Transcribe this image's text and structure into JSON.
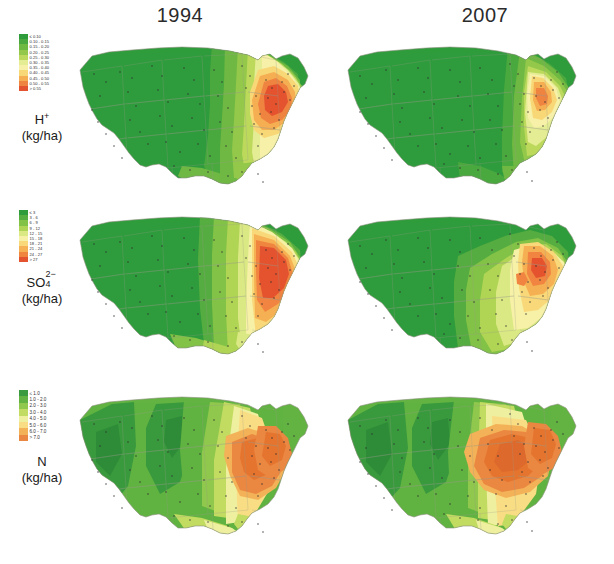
{
  "figure": {
    "columns": [
      {
        "label": "1994"
      },
      {
        "label": "2007"
      }
    ],
    "caption": ""
  },
  "rows": [
    {
      "id": "hydrogen",
      "symbol": "H",
      "symbol_charge": "+",
      "unit": "(kg/ha)",
      "legend": {
        "classes": [
          {
            "label": "≤ 0.10",
            "color": "#2f9c3c"
          },
          {
            "label": "0.10 - 0.15",
            "color": "#4aa83f"
          },
          {
            "label": "0.15 - 0.20",
            "color": "#6fb943"
          },
          {
            "label": "0.20 - 0.25",
            "color": "#93c84b"
          },
          {
            "label": "0.25 - 0.30",
            "color": "#bcd95d"
          },
          {
            "label": "0.30 - 0.35",
            "color": "#e4ec94"
          },
          {
            "label": "0.35 - 0.40",
            "color": "#f6f0a8"
          },
          {
            "label": "0.40 - 0.45",
            "color": "#f8d777"
          },
          {
            "label": "0.45 - 0.50",
            "color": "#f5ae52"
          },
          {
            "label": "0.50 - 0.55",
            "color": "#ef8340"
          },
          {
            "label": "> 0.55",
            "color": "#e4532f"
          }
        ]
      }
    },
    {
      "id": "sulfate",
      "symbol": "SO",
      "symbol_charge": "2−",
      "symbol_sub": "4",
      "unit": "(kg/ha)",
      "legend": {
        "classes": [
          {
            "label": "≤ 3",
            "color": "#2f9c3c"
          },
          {
            "label": "3 - 6",
            "color": "#56ad40"
          },
          {
            "label": "6 - 9",
            "color": "#82c247"
          },
          {
            "label": "9 - 12",
            "color": "#b0d455"
          },
          {
            "label": "12 - 15",
            "color": "#dbe985"
          },
          {
            "label": "15 - 18",
            "color": "#f6f1a6"
          },
          {
            "label": "18 - 21",
            "color": "#f9d87a"
          },
          {
            "label": "21 - 24",
            "color": "#f5b153"
          },
          {
            "label": "24 - 27",
            "color": "#f08540"
          },
          {
            "label": "> 27",
            "color": "#e4532f"
          }
        ]
      }
    },
    {
      "id": "nitrogen",
      "symbol": "N",
      "symbol_charge": "",
      "unit": "(kg/ha)",
      "legend": {
        "classes": [
          {
            "label": "≤ 1.0",
            "color": "#3a9a3e"
          },
          {
            "label": "1.0 - 2.0",
            "color": "#62b342"
          },
          {
            "label": "2.0 - 3.0",
            "color": "#8fc84c"
          },
          {
            "label": "3.0 - 4.0",
            "color": "#c2db62"
          },
          {
            "label": "4.0 - 5.0",
            "color": "#eef0a0"
          },
          {
            "label": "5.0 - 6.0",
            "color": "#f9dd84"
          },
          {
            "label": "6.0 - 7.0",
            "color": "#f3b257"
          },
          {
            "label": "> 7.0",
            "color": "#ea8742"
          }
        ]
      }
    }
  ],
  "chart_data": {
    "type": "heatmap",
    "xlabel": "",
    "ylabel": "",
    "legend_position": "left-of-each-row",
    "grid": false,
    "panels": [
      {
        "row": "H+ (kg/ha)",
        "year": "1994",
        "units": "kg/ha",
        "regional_values": [
          {
            "region": "Pacific Northwest",
            "value": 0.08
          },
          {
            "region": "California",
            "value": 0.07
          },
          {
            "region": "Intermountain West",
            "value": 0.07
          },
          {
            "region": "Northern Plains",
            "value": 0.09
          },
          {
            "region": "Southern Plains",
            "value": 0.1
          },
          {
            "region": "Upper Midwest",
            "value": 0.18
          },
          {
            "region": "Ohio Valley",
            "value": 0.5
          },
          {
            "region": "Western Pennsylvania",
            "value": 0.58
          },
          {
            "region": "Northeast",
            "value": 0.45
          },
          {
            "region": "Mid-Atlantic",
            "value": 0.4
          },
          {
            "region": "Southeast",
            "value": 0.27
          },
          {
            "region": "Gulf Coast",
            "value": 0.2
          },
          {
            "region": "Florida",
            "value": 0.17
          }
        ],
        "max_class": "> 0.55",
        "hotspot": "Ohio Valley / western Pennsylvania"
      },
      {
        "row": "H+ (kg/ha)",
        "year": "2007",
        "units": "kg/ha",
        "regional_values": [
          {
            "region": "Pacific Northwest",
            "value": 0.06
          },
          {
            "region": "California",
            "value": 0.06
          },
          {
            "region": "Intermountain West",
            "value": 0.06
          },
          {
            "region": "Northern Plains",
            "value": 0.07
          },
          {
            "region": "Southern Plains",
            "value": 0.08
          },
          {
            "region": "Upper Midwest",
            "value": 0.1
          },
          {
            "region": "Ohio Valley",
            "value": 0.42
          },
          {
            "region": "Western Pennsylvania",
            "value": 0.48
          },
          {
            "region": "Northeast",
            "value": 0.28
          },
          {
            "region": "Mid-Atlantic",
            "value": 0.3
          },
          {
            "region": "Southeast",
            "value": 0.16
          },
          {
            "region": "Gulf Coast",
            "value": 0.14
          },
          {
            "region": "Florida",
            "value": 0.12
          }
        ],
        "max_class": "0.45 - 0.50",
        "hotspot": "Ohio Valley / western Pennsylvania (much reduced)"
      },
      {
        "row": "SO4-2 (kg/ha)",
        "year": "1994",
        "units": "kg/ha",
        "regional_values": [
          {
            "region": "Pacific Northwest",
            "value": 2
          },
          {
            "region": "California",
            "value": 2
          },
          {
            "region": "Intermountain West",
            "value": 2
          },
          {
            "region": "Northern Plains",
            "value": 3
          },
          {
            "region": "Southern Plains",
            "value": 5
          },
          {
            "region": "Upper Midwest",
            "value": 11
          },
          {
            "region": "Ohio Valley",
            "value": 26
          },
          {
            "region": "Western Pennsylvania",
            "value": 29
          },
          {
            "region": "Northeast",
            "value": 20
          },
          {
            "region": "Mid-Atlantic",
            "value": 22
          },
          {
            "region": "Southeast",
            "value": 15
          },
          {
            "region": "Gulf Coast",
            "value": 12
          },
          {
            "region": "Florida",
            "value": 11
          }
        ],
        "max_class": "> 27",
        "hotspot": "Ohio Valley / western Pennsylvania"
      },
      {
        "row": "SO4-2 (kg/ha)",
        "year": "2007",
        "units": "kg/ha",
        "regional_values": [
          {
            "region": "Pacific Northwest",
            "value": 2
          },
          {
            "region": "California",
            "value": 2
          },
          {
            "region": "Intermountain West",
            "value": 2
          },
          {
            "region": "Northern Plains",
            "value": 3
          },
          {
            "region": "Southern Plains",
            "value": 4
          },
          {
            "region": "Upper Midwest",
            "value": 8
          },
          {
            "region": "Ohio Valley",
            "value": 22
          },
          {
            "region": "Western Pennsylvania",
            "value": 25
          },
          {
            "region": "Northeast",
            "value": 14
          },
          {
            "region": "Mid-Atlantic",
            "value": 16
          },
          {
            "region": "Southeast",
            "value": 11
          },
          {
            "region": "Gulf Coast",
            "value": 9
          },
          {
            "region": "Florida",
            "value": 8
          }
        ],
        "max_class": "24 - 27",
        "hotspot": "Ohio Valley (reduced extent)"
      },
      {
        "row": "N (kg/ha)",
        "year": "1994",
        "units": "kg/ha",
        "regional_values": [
          {
            "region": "Pacific Northwest",
            "value": 1.4
          },
          {
            "region": "California",
            "value": 1.8
          },
          {
            "region": "Intermountain West",
            "value": 1.3
          },
          {
            "region": "Northern Plains",
            "value": 3.0
          },
          {
            "region": "Southern Plains",
            "value": 4.2
          },
          {
            "region": "Upper Midwest",
            "value": 5.5
          },
          {
            "region": "Ohio Valley",
            "value": 6.8
          },
          {
            "region": "Western Pennsylvania",
            "value": 7.4
          },
          {
            "region": "Northeast",
            "value": 6.2
          },
          {
            "region": "Mid-Atlantic",
            "value": 6.5
          },
          {
            "region": "Southeast",
            "value": 4.8
          },
          {
            "region": "Gulf Coast",
            "value": 4.5
          },
          {
            "region": "Florida",
            "value": 3.5
          }
        ],
        "max_class": "> 7.0",
        "hotspot": "Ohio Valley, Indiana, Illinois and the Northeast"
      },
      {
        "row": "N (kg/ha)",
        "year": "2007",
        "units": "kg/ha",
        "regional_values": [
          {
            "region": "Pacific Northwest",
            "value": 1.6
          },
          {
            "region": "California",
            "value": 2.0
          },
          {
            "region": "Intermountain West",
            "value": 1.5
          },
          {
            "region": "Northern Plains",
            "value": 3.4
          },
          {
            "region": "Southern Plains",
            "value": 4.0
          },
          {
            "region": "Upper Midwest",
            "value": 5.8
          },
          {
            "region": "Ohio Valley",
            "value": 7.2
          },
          {
            "region": "Iowa / Nebraska",
            "value": 7.3
          },
          {
            "region": "Northeast",
            "value": 6.0
          },
          {
            "region": "Mid-Atlantic",
            "value": 6.4
          },
          {
            "region": "Southeast",
            "value": 4.4
          },
          {
            "region": "Gulf Coast",
            "value": 4.2
          },
          {
            "region": "Florida",
            "value": 3.2
          }
        ],
        "max_class": "> 7.0",
        "hotspot": "Corn Belt (Iowa, Illinois, Indiana, Ohio)"
      }
    ]
  }
}
